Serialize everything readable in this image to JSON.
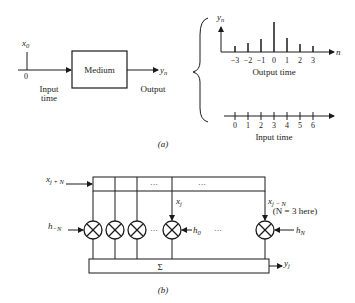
{
  "part_a": {
    "caption": "(a)",
    "input_label": "x",
    "input_sub": "0",
    "input_tick": "0",
    "input_axis_label_1": "Input",
    "input_axis_label_2": "time",
    "box_label": "Medium",
    "output_symbol": "y",
    "output_sub": "n",
    "output_label": "Output",
    "output_plot": {
      "y_label": "y",
      "y_sub": "n",
      "x_var": "n",
      "x_title": "Output time",
      "ticks": [
        "−3",
        "−2",
        "−1",
        "0",
        "1",
        "2",
        "3"
      ],
      "stem_heights": [
        0.2,
        0.3,
        0.45,
        1.0,
        0.5,
        0.28,
        0.2
      ]
    },
    "input_axis": {
      "title": "Input time",
      "ticks": [
        "0",
        "1",
        "2",
        "3",
        "4",
        "5",
        "6"
      ]
    }
  },
  "part_b": {
    "caption": "(b)",
    "input_top": "x",
    "input_top_sub": "j + N",
    "x_j": "x",
    "x_j_sub": "j",
    "x_jn": "x",
    "x_jn_sub": "j − N",
    "h_left": "h",
    "h_left_sub": "−N",
    "h_mid": "h",
    "h_mid_sub": "0",
    "h_right": "h",
    "h_right_sub": "N",
    "ellipsis": "···",
    "sum_label": "Σ",
    "output": "y",
    "output_sub": "j",
    "note": "(N = 3 here)"
  }
}
